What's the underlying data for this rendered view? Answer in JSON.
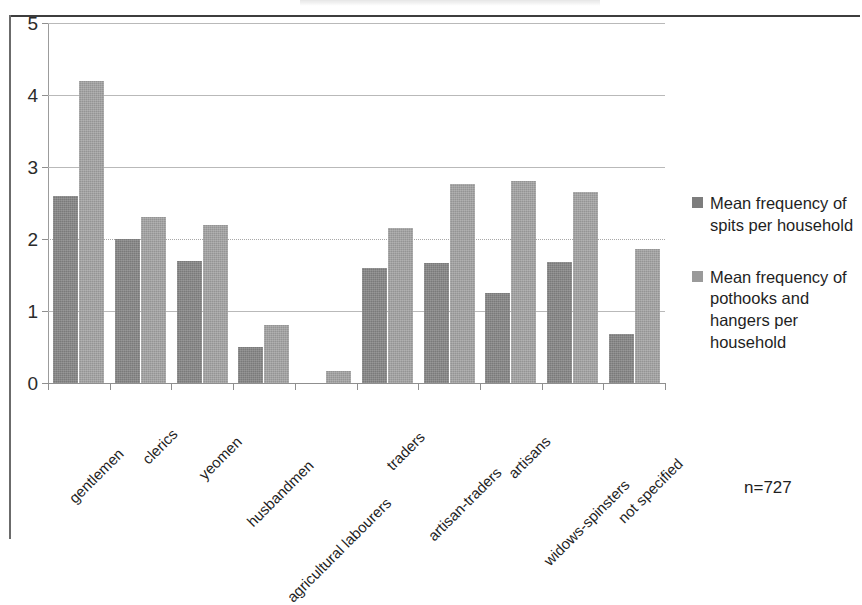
{
  "chart_data": {
    "type": "bar",
    "title": "",
    "xlabel": "",
    "ylabel": "",
    "ylim": [
      0,
      5
    ],
    "yticks": [
      "0",
      "1",
      "2",
      "3",
      "4",
      "5"
    ],
    "grid": true,
    "legend_position": "right",
    "categories": [
      "gentlemen",
      "clerics",
      "yeomen",
      "husbandmen",
      "agricultural labourers",
      "traders",
      "artisan-traders",
      "artisans",
      "widows-spinsters",
      "not specified"
    ],
    "series": [
      {
        "name": "Mean frequency of spits per household",
        "color": "#7a7a7a",
        "values": [
          2.6,
          2.0,
          1.7,
          0.5,
          0,
          1.6,
          1.67,
          1.25,
          1.68,
          0.68
        ]
      },
      {
        "name": "Mean frequency of pothooks and hangers per household",
        "color": "#949494",
        "values": [
          4.2,
          2.3,
          2.2,
          0.8,
          0.17,
          2.15,
          2.77,
          2.8,
          2.65,
          1.86
        ]
      }
    ],
    "annotations": [
      {
        "text": "n=727"
      }
    ]
  },
  "legend": {
    "items": [
      {
        "label": "Mean frequency of spits per household"
      },
      {
        "label": "Mean frequency of pothooks and hangers per household"
      }
    ]
  },
  "annotation": {
    "sample_size": "n=727"
  },
  "colors": {
    "series_1": "#7a7a7a",
    "series_2": "#949494",
    "gridline": "#b9b9b9",
    "axis": "#8f8f8f",
    "text": "#1f1f1f"
  }
}
